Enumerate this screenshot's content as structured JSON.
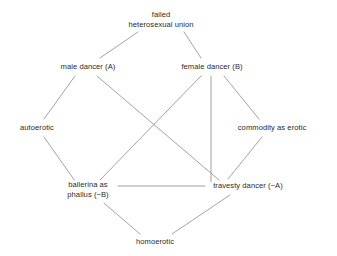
{
  "diagram": {
    "background_color": "#ffffff",
    "line_color": "#8c8c8c",
    "text_color": "#2b2b2b",
    "nodes": [
      {
        "id": "failed-union",
        "line1": "failed",
        "line2": "heterosexual union",
        "x": 161,
        "y": 20
      },
      {
        "id": "male-dancer",
        "line1": "male dancer (A)",
        "line2": "",
        "x": 88,
        "y": 67
      },
      {
        "id": "female-dancer",
        "line1": "female dancer (B)",
        "line2": "",
        "x": 212,
        "y": 67
      },
      {
        "id": "autoerotic",
        "line1": "autoerotic",
        "line2": "",
        "x": 37,
        "y": 128
      },
      {
        "id": "commodity-erotic",
        "line1": "commodity as erotic",
        "line2": "",
        "x": 272,
        "y": 128
      },
      {
        "id": "ballerina-phallus",
        "line1": "ballerina as",
        "line2": "phallus (−B)",
        "x": 88,
        "y": 190
      },
      {
        "id": "travesty-dancer",
        "line1": "travesty dancer (−A)",
        "line2": "",
        "x": 248,
        "y": 186
      },
      {
        "id": "homoerotic",
        "line1": "homoerotic",
        "line2": "",
        "x": 155,
        "y": 242
      }
    ],
    "edges": [
      {
        "id": "failed-union--male-dancer",
        "x1": 138,
        "y1": 32,
        "x2": 100,
        "y2": 58
      },
      {
        "id": "failed-union--female-dancer",
        "x1": 184,
        "y1": 32,
        "x2": 201,
        "y2": 58
      },
      {
        "id": "male-dancer--autoerotic",
        "x1": 75,
        "y1": 76,
        "x2": 44,
        "y2": 119
      },
      {
        "id": "male-dancer--travesty-dancer",
        "x1": 97,
        "y1": 76,
        "x2": 219,
        "y2": 180
      },
      {
        "id": "female-dancer--ballerina-phallus",
        "x1": 201,
        "y1": 76,
        "x2": 100,
        "y2": 180
      },
      {
        "id": "female-dancer--travesty-dancer",
        "x1": 211,
        "y1": 76,
        "x2": 211,
        "y2": 182
      },
      {
        "id": "female-dancer--commodity-erotic",
        "x1": 224,
        "y1": 76,
        "x2": 259,
        "y2": 119
      },
      {
        "id": "autoerotic--ballerina-phallus",
        "x1": 44,
        "y1": 137,
        "x2": 75,
        "y2": 181
      },
      {
        "id": "commodity-erotic--travesty-dancer",
        "x1": 262,
        "y1": 137,
        "x2": 228,
        "y2": 179
      },
      {
        "id": "ballerina-phallus--travesty-dancer",
        "x1": 118,
        "y1": 186,
        "x2": 205,
        "y2": 186
      },
      {
        "id": "ballerina-phallus--homoerotic",
        "x1": 104,
        "y1": 203,
        "x2": 140,
        "y2": 234
      },
      {
        "id": "travesty-dancer--homoerotic",
        "x1": 230,
        "y1": 195,
        "x2": 172,
        "y2": 234
      }
    ]
  }
}
